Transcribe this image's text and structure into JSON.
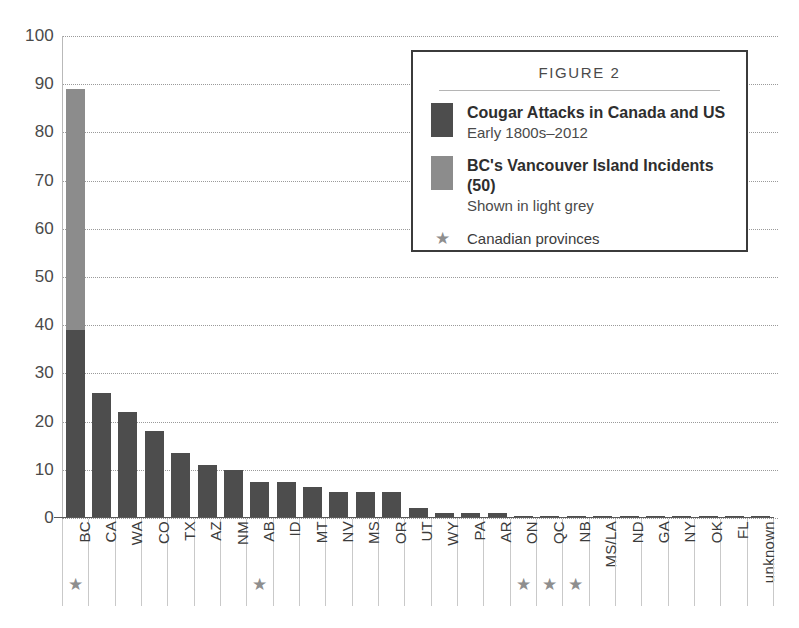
{
  "chart_data": {
    "type": "bar",
    "title": "FIGURE 2",
    "xlabel": "",
    "ylabel": "",
    "ylim": [
      0,
      100
    ],
    "yticks": [
      100,
      90,
      80,
      70,
      60,
      50,
      40,
      30,
      20,
      10,
      0
    ],
    "grid": true,
    "legend_position": "top-right",
    "categories": [
      "BC",
      "CA",
      "WA",
      "CO",
      "TX",
      "AZ",
      "NM",
      "AB",
      "ID",
      "MT",
      "NV",
      "MS",
      "OR",
      "UT",
      "WY",
      "PA",
      "AR",
      "ON",
      "QC",
      "NB",
      "MS/LA",
      "ND",
      "GA",
      "NY",
      "OK",
      "FL",
      "unknown"
    ],
    "values": [
      89,
      26,
      22,
      18,
      13.5,
      11,
      10,
      7.5,
      7.5,
      6.5,
      5.5,
      5.5,
      5.5,
      2,
      1,
      1,
      1,
      0.5,
      0.5,
      0.5,
      0.5,
      0.5,
      0.5,
      0.5,
      0.5,
      0.5,
      0.5
    ],
    "series": [
      {
        "name": "Cougar Attacks in Canada and US",
        "color": "#4d4d4d",
        "values": [
          39,
          26,
          22,
          18,
          13.5,
          11,
          10,
          7.5,
          7.5,
          6.5,
          5.5,
          5.5,
          5.5,
          2,
          1,
          1,
          1,
          0.5,
          0.5,
          0.5,
          0.5,
          0.5,
          0.5,
          0.5,
          0.5,
          0.5,
          0.5
        ]
      },
      {
        "name": "BC's Vancouver Island Incidents (50)",
        "color": "#8c8c8c",
        "values": [
          50,
          0,
          0,
          0,
          0,
          0,
          0,
          0,
          0,
          0,
          0,
          0,
          0,
          0,
          0,
          0,
          0,
          0,
          0,
          0,
          0,
          0,
          0,
          0,
          0,
          0,
          0
        ]
      }
    ],
    "canadian_provinces": [
      "BC",
      "AB",
      "ON",
      "QC",
      "NB"
    ],
    "star_marks": [
      true,
      false,
      false,
      false,
      false,
      false,
      false,
      true,
      false,
      false,
      false,
      false,
      false,
      false,
      false,
      false,
      false,
      true,
      true,
      true,
      false,
      false,
      false,
      false,
      false,
      false,
      false
    ]
  },
  "legend": {
    "title": "FIGURE 2",
    "rows": [
      {
        "swatch": "dark",
        "main": "Cougar Attacks in Canada and US",
        "sub": "Early 1800s–2012"
      },
      {
        "swatch": "light",
        "main": "BC's Vancouver Island Incidents (50)",
        "sub": "Shown in light grey"
      }
    ],
    "star_symbol": "★",
    "star_label": "Canadian provinces"
  },
  "colors": {
    "bar_dark": "#4d4d4d",
    "bar_light": "#8c8c8c",
    "grid": "#9a9a9a",
    "axis": "#5a5a5a",
    "star": "#8e8e8e",
    "legend_border": "#3b3b3b",
    "background": "#ffffff"
  }
}
